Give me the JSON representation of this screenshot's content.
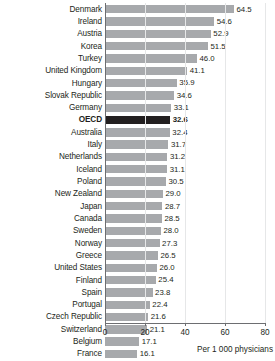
{
  "chart_data": {
    "type": "bar",
    "orientation": "horizontal",
    "title": "",
    "subtitle": "",
    "xlabel": "Per 1 000 physicians",
    "ylabel": "",
    "xlim": [
      0,
      80
    ],
    "xticks": [
      0,
      20,
      40,
      60,
      80
    ],
    "xtick_labels": [
      "0",
      "20",
      "40",
      "60",
      "80"
    ],
    "grid": true,
    "grid_axis": "x",
    "legend": null,
    "highlight_category": "OECD",
    "colors": {
      "bar": "#a7a9ac",
      "bar_highlight": "#231f20",
      "axis": "#6d6e71",
      "gridline": "#e6e7e8",
      "text": "#231f20",
      "background": "#ffffff"
    },
    "categories": [
      "Denmark",
      "Ireland",
      "Austria",
      "Korea",
      "Turkey",
      "United Kingdom",
      "Hungary",
      "Slovak Republic",
      "Germany",
      "OECD",
      "Australia",
      "Italy",
      "Netherlands",
      "Iceland",
      "Poland",
      "New Zealand",
      "Japan",
      "Canada",
      "Sweden",
      "Norway",
      "Greece",
      "United States",
      "Finland",
      "Spain",
      "Portugal",
      "Czech Republic",
      "Switzerland",
      "Belgium",
      "France"
    ],
    "values": [
      64.5,
      54.6,
      52.9,
      51.5,
      46.0,
      41.1,
      35.9,
      34.6,
      33.1,
      32.6,
      32.4,
      31.7,
      31.2,
      31.1,
      30.5,
      29.0,
      28.7,
      28.5,
      28.0,
      27.3,
      26.5,
      26.0,
      25.4,
      23.8,
      22.4,
      21.6,
      21.1,
      17.1,
      16.1
    ],
    "value_labels": [
      "64.5",
      "54.6",
      "52.9",
      "51.5",
      "46.0",
      "41.1",
      "35.9",
      "34.6",
      "33.1",
      "32.6",
      "32.4",
      "31.7",
      "31.2",
      "31.1",
      "30.5",
      "29.0",
      "28.7",
      "28.5",
      "28.0",
      "27.3",
      "26.5",
      "26.0",
      "25.4",
      "23.8",
      "22.4",
      "21.6",
      "21.1",
      "17.1",
      "16.1"
    ]
  }
}
